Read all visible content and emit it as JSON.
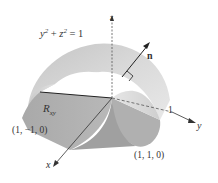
{
  "figure": {
    "surface_equation": "y² + z² = 1",
    "equation_parts": {
      "y": "y",
      "y_exp": "2",
      "plus": " + ",
      "z": "z",
      "z_exp": "2",
      "rhs": " = 1"
    },
    "region_label": {
      "main": "R",
      "sub": "xy"
    },
    "normal_label": "n",
    "axes": {
      "x": "x",
      "y": "y",
      "z": "z"
    },
    "tick_label_y": "1",
    "points": {
      "corner_left": "(1, −1, 0)",
      "corner_right": "(1, 1, 0)"
    }
  },
  "colors": {
    "surface_light": "#d8d8d8",
    "surface_mid": "#bdbdbd",
    "surface_dark": "#9a9a9a",
    "region": "#a8a8a8",
    "axis": "#333333"
  }
}
